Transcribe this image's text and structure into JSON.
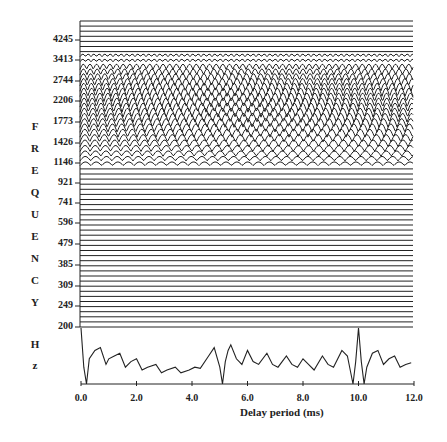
{
  "chart_data": {
    "type": "line",
    "title": "",
    "xlabel": "Delay period (ms)",
    "ylabel": "FREQUENCY Hz",
    "ylabel_letters": [
      "F",
      "R",
      "E",
      "Q",
      "U",
      "E",
      "N",
      "C",
      "Y",
      "",
      "H",
      "z"
    ],
    "x_ticks": [
      "0.0",
      "2.0",
      "4.0",
      "6.0",
      "8.0",
      "10.0",
      "12.0"
    ],
    "x_range": [
      0,
      12
    ],
    "y_ticks": [
      "4245",
      "3413",
      "2744",
      "2206",
      "1773",
      "1426",
      "1146",
      "921",
      "741",
      "596",
      "479",
      "385",
      "309",
      "249",
      "200"
    ],
    "y_scale": "log",
    "grid": false,
    "legend": null,
    "panels": [
      {
        "name": "frequency-channel-traces",
        "description": "Stack of horizontal traces, one per frequency channel (~60 channels, 200–~5000 Hz). Channels between ~1146 Hz and ~3413 Hz show periodic oscillation, others are flat.",
        "oscillating_band_hz": [
          1146,
          3600
        ],
        "num_traces": 61
      },
      {
        "name": "summary-trace",
        "description": "Summary autocorrelation-like trace across delay period, with strong peak near 10.0 ms and secondary peaks near 5.0 ms",
        "x": [
          0.0,
          0.1,
          0.2,
          0.3,
          0.5,
          0.7,
          0.9,
          1.0,
          1.2,
          1.4,
          1.6,
          1.8,
          2.0,
          2.2,
          2.4,
          2.7,
          2.9,
          3.1,
          3.4,
          3.6,
          3.9,
          4.1,
          4.3,
          4.6,
          4.8,
          5.0,
          5.1,
          5.2,
          5.3,
          5.4,
          5.6,
          5.8,
          6.0,
          6.2,
          6.4,
          6.7,
          6.9,
          7.1,
          7.4,
          7.6,
          7.8,
          8.0,
          8.2,
          8.4,
          8.7,
          8.9,
          9.1,
          9.4,
          9.6,
          9.8,
          9.9,
          10.0,
          10.1,
          10.2,
          10.3,
          10.5,
          10.7,
          10.9,
          11.1,
          11.3,
          11.5,
          11.7,
          11.9
        ],
        "y": [
          1.0,
          0.3,
          0.0,
          0.45,
          0.6,
          0.65,
          0.35,
          0.45,
          0.5,
          0.55,
          0.3,
          0.4,
          0.45,
          0.25,
          0.3,
          0.35,
          0.2,
          0.25,
          0.3,
          0.2,
          0.25,
          0.3,
          0.28,
          0.5,
          0.65,
          0.3,
          0.0,
          0.4,
          0.6,
          0.7,
          0.45,
          0.35,
          0.6,
          0.4,
          0.35,
          0.55,
          0.35,
          0.3,
          0.5,
          0.35,
          0.3,
          0.45,
          0.35,
          0.25,
          0.5,
          0.35,
          0.3,
          0.6,
          0.5,
          0.0,
          0.4,
          1.0,
          0.4,
          0.0,
          0.3,
          0.55,
          0.6,
          0.35,
          0.45,
          0.5,
          0.3,
          0.35,
          0.38
        ]
      }
    ]
  }
}
